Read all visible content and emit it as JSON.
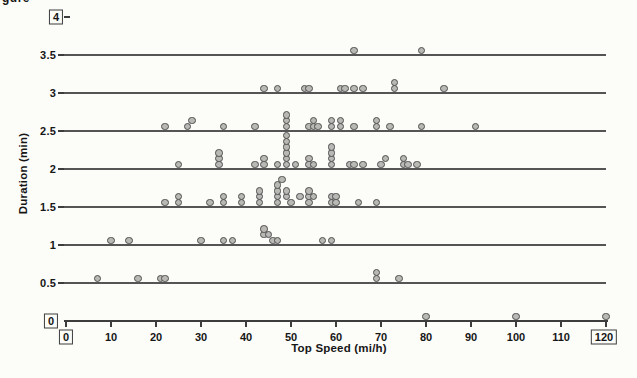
{
  "page": {
    "clipped_text_fragment": "gure"
  },
  "chart_data": {
    "type": "scatter",
    "title": "",
    "xlabel": "Top Speed (mi/h)",
    "ylabel": "Duration (min)",
    "xlim": [
      0,
      120
    ],
    "ylim": [
      0,
      4
    ],
    "x_ticks": [
      0,
      10,
      20,
      30,
      40,
      50,
      60,
      70,
      80,
      90,
      100,
      110,
      120
    ],
    "y_ticks": [
      0,
      0.5,
      1,
      1.5,
      2,
      2.5,
      3,
      3.5,
      4
    ],
    "boxed_x_ticks": [
      0,
      120
    ],
    "boxed_y_ticks": [
      0,
      4
    ],
    "grid_lines_at_y": [
      0.5,
      1,
      1.5,
      2,
      2.5,
      3,
      3.5
    ],
    "legend": "none",
    "marker": "circle",
    "points_encoding": "[top_speed_mi_h, stack_level_above_line]",
    "rows": [
      {
        "duration": 0,
        "points": [
          [
            80,
            0
          ],
          [
            100,
            0
          ],
          [
            120,
            0
          ]
        ]
      },
      {
        "duration": 0.5,
        "points": [
          [
            7,
            0
          ],
          [
            16,
            0
          ],
          [
            21,
            0
          ],
          [
            22,
            0
          ],
          [
            69,
            0
          ],
          [
            69,
            1
          ],
          [
            74,
            0
          ]
        ]
      },
      {
        "duration": 1,
        "points": [
          [
            10,
            0
          ],
          [
            14,
            0
          ],
          [
            30,
            0
          ],
          [
            35,
            0
          ],
          [
            37,
            0
          ],
          [
            44,
            1
          ],
          [
            44,
            2
          ],
          [
            45,
            1
          ],
          [
            46,
            0
          ],
          [
            47,
            0
          ],
          [
            57,
            0
          ],
          [
            59,
            0
          ]
        ]
      },
      {
        "duration": 1.5,
        "points": [
          [
            22,
            0
          ],
          [
            25,
            0
          ],
          [
            25,
            1
          ],
          [
            32,
            0
          ],
          [
            35,
            0
          ],
          [
            35,
            1
          ],
          [
            39,
            0
          ],
          [
            39,
            1
          ],
          [
            43,
            0
          ],
          [
            43,
            1
          ],
          [
            43,
            2
          ],
          [
            47,
            0
          ],
          [
            47,
            1
          ],
          [
            47,
            2
          ],
          [
            47,
            3
          ],
          [
            48,
            4
          ],
          [
            49,
            1
          ],
          [
            49,
            2
          ],
          [
            50,
            0
          ],
          [
            52,
            1
          ],
          [
            54,
            0
          ],
          [
            54,
            1
          ],
          [
            54,
            2
          ],
          [
            55,
            1
          ],
          [
            59,
            0
          ],
          [
            59,
            1
          ],
          [
            60,
            0
          ],
          [
            60,
            1
          ],
          [
            65,
            0
          ],
          [
            69,
            0
          ]
        ]
      },
      {
        "duration": 2,
        "points": [
          [
            25,
            0
          ],
          [
            34,
            0
          ],
          [
            34,
            1
          ],
          [
            34,
            2
          ],
          [
            42,
            0
          ],
          [
            44,
            0
          ],
          [
            44,
            1
          ],
          [
            47,
            0
          ],
          [
            49,
            0
          ],
          [
            49,
            1
          ],
          [
            49,
            2
          ],
          [
            49,
            3
          ],
          [
            49,
            4
          ],
          [
            49,
            5
          ],
          [
            51,
            0
          ],
          [
            54,
            0
          ],
          [
            54,
            1
          ],
          [
            55,
            0
          ],
          [
            59,
            0
          ],
          [
            59,
            1
          ],
          [
            59,
            2
          ],
          [
            59,
            3
          ],
          [
            63,
            0
          ],
          [
            64,
            0
          ],
          [
            66,
            0
          ],
          [
            70,
            0
          ],
          [
            71,
            1
          ],
          [
            75,
            0
          ],
          [
            75,
            1
          ],
          [
            76,
            0
          ],
          [
            78,
            0
          ]
        ]
      },
      {
        "duration": 2.5,
        "points": [
          [
            22,
            0
          ],
          [
            27,
            0
          ],
          [
            28,
            1
          ],
          [
            35,
            0
          ],
          [
            42,
            0
          ],
          [
            49,
            0
          ],
          [
            49,
            1
          ],
          [
            49,
            2
          ],
          [
            54,
            0
          ],
          [
            55,
            0
          ],
          [
            55,
            1
          ],
          [
            56,
            0
          ],
          [
            59,
            0
          ],
          [
            59,
            1
          ],
          [
            61,
            0
          ],
          [
            61,
            1
          ],
          [
            64,
            0
          ],
          [
            69,
            0
          ],
          [
            69,
            1
          ],
          [
            72,
            0
          ],
          [
            79,
            0
          ],
          [
            91,
            0
          ]
        ]
      },
      {
        "duration": 3,
        "points": [
          [
            44,
            0
          ],
          [
            47,
            0
          ],
          [
            53,
            0
          ],
          [
            54,
            0
          ],
          [
            61,
            0
          ],
          [
            62,
            0
          ],
          [
            64,
            0
          ],
          [
            66,
            0
          ],
          [
            73,
            0
          ],
          [
            73,
            1
          ],
          [
            84,
            0
          ]
        ]
      },
      {
        "duration": 3.5,
        "points": [
          [
            64,
            0
          ],
          [
            79,
            0
          ]
        ]
      }
    ],
    "colors": {
      "marker_fill": "#b9b8b4",
      "marker_stroke": "#4f4f4f",
      "line": "#3d3d3d",
      "text": "#161616",
      "background": "#fcfcf9"
    }
  }
}
